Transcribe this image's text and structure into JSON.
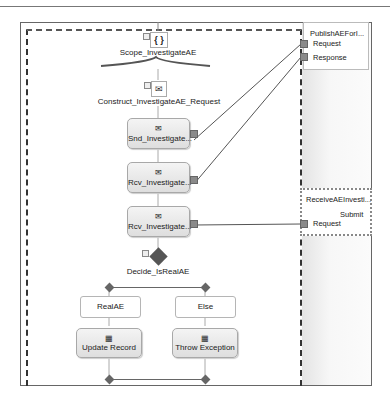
{
  "diagram": {
    "scope": {
      "label": "Scope_InvestigateAE",
      "icon": "scope-braces-icon"
    },
    "construct": {
      "label": "Construct_InvestigateAE_Request",
      "icon": "construct-message-icon"
    },
    "shapes": [
      {
        "label": "Snd_Investigate...",
        "icon": "send-envelope-icon"
      },
      {
        "label": "Rcv_Investigate...",
        "icon": "receive-envelope-icon"
      },
      {
        "label": "Rcv_Investigate...",
        "icon": "receive-envelope-icon"
      }
    ],
    "decide": {
      "label": "Decide_IsRealAE"
    },
    "branches": [
      {
        "rule": "RealAE",
        "action": "Update Record"
      },
      {
        "rule": "Else",
        "action": "Throw Exception"
      }
    ]
  },
  "ports": [
    {
      "title": "PublishAEForI...",
      "operation": null,
      "messages": [
        "Request",
        "Response"
      ]
    },
    {
      "title": "ReceiveAEInvesti...",
      "operation": "Submit",
      "messages": [
        "Request"
      ]
    }
  ]
}
